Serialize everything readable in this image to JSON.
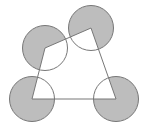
{
  "diagram": {
    "type": "geometry",
    "colors": {
      "background": "#ffffff",
      "stroke": "#777777",
      "shade": "#bdbdbd"
    },
    "radius": 22.5,
    "vertices": [
      {
        "id": "A",
        "x": 32,
        "y": 99
      },
      {
        "id": "B",
        "x": 45,
        "y": 48
      },
      {
        "id": "C",
        "x": 91,
        "y": 28
      },
      {
        "id": "D",
        "x": 116,
        "y": 99
      }
    ]
  }
}
